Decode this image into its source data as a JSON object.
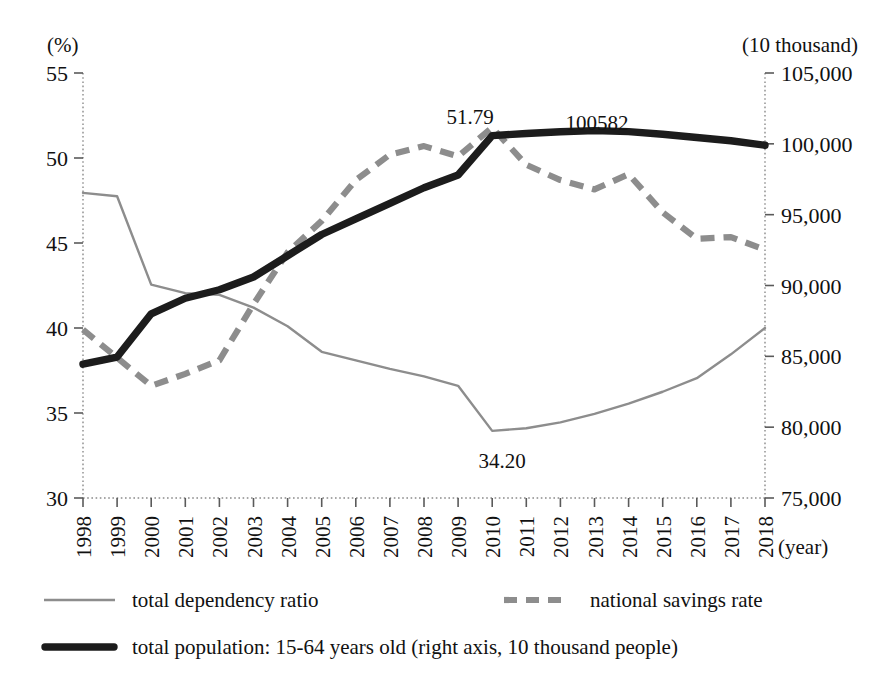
{
  "chart_data": {
    "type": "line",
    "title": "",
    "xlabel": "(year)",
    "ylabel": "(%)",
    "y2label": "(10 thousand)",
    "grid": false,
    "legend_position": "bottom",
    "x": [
      1998,
      1999,
      2000,
      2001,
      2002,
      2003,
      2004,
      2005,
      2006,
      2007,
      2008,
      2009,
      2010,
      2011,
      2012,
      2013,
      2014,
      2015,
      2016,
      2017,
      2018
    ],
    "categories": [
      "1998",
      "1999",
      "2000",
      "2001",
      "2002",
      "2003",
      "2004",
      "2005",
      "2006",
      "2007",
      "2008",
      "2009",
      "2010",
      "2011",
      "2012",
      "2013",
      "2014",
      "2015",
      "2016",
      "2017",
      "2018"
    ],
    "ylim": [
      30,
      55
    ],
    "yticks": [
      30,
      35,
      40,
      45,
      50,
      55
    ],
    "ytick_labels": [
      "30",
      "35",
      "40",
      "45",
      "50",
      "55"
    ],
    "y2lim": [
      75000,
      105000
    ],
    "y2ticks": [
      75000,
      80000,
      85000,
      90000,
      95000,
      100000,
      105000
    ],
    "y2tick_labels": [
      "75,000",
      "80,000",
      "85,000",
      "90,000",
      "95,000",
      "100,000",
      "105,000"
    ],
    "series": [
      {
        "name": "total dependency ratio",
        "axis": "left",
        "style": "thin-solid",
        "color": "#8d8d8d",
        "values": [
          47.95,
          47.75,
          42.55,
          42.05,
          41.95,
          41.2,
          40.1,
          38.6,
          38.1,
          37.6,
          37.15,
          36.6,
          33.95,
          34.1,
          34.45,
          34.95,
          35.55,
          36.25,
          37.05,
          38.45,
          40.0
        ]
      },
      {
        "name": "national savings rate",
        "axis": "left",
        "style": "dashed",
        "color": "#8d8d8d",
        "values": [
          39.9,
          38.25,
          36.6,
          37.3,
          38.1,
          41.4,
          44.45,
          46.3,
          48.7,
          50.2,
          50.7,
          50.1,
          51.79,
          49.6,
          48.7,
          48.15,
          49.05,
          46.8,
          45.25,
          45.35,
          44.6
        ]
      },
      {
        "name": "total population: 15-64 years old (right axis, 10 thousand people)",
        "axis": "right",
        "style": "thick-solid",
        "color": "#1c1c1c",
        "values": [
          84450,
          84950,
          88000,
          89100,
          89700,
          90600,
          92100,
          93600,
          94700,
          95800,
          96900,
          97800,
          100582,
          100730,
          100850,
          100930,
          100860,
          100680,
          100450,
          100220,
          99900
        ]
      }
    ],
    "annotations": [
      {
        "text": "51.79",
        "series": "national savings rate",
        "x": 2010,
        "value": 51.79
      },
      {
        "text": "100582",
        "series": "total population: 15-64 years old (right axis, 10 thousand people)",
        "x": 2010,
        "value": 100582
      },
      {
        "text": "34.20",
        "series": "total dependency ratio",
        "x": 2010,
        "value": 33.95
      }
    ]
  },
  "axes": {
    "left_unit": "(%)",
    "right_unit": "(10 thousand)",
    "x_unit": "(year)"
  },
  "legend": {
    "items": [
      {
        "label": "total dependency ratio",
        "style": "thin-solid"
      },
      {
        "label": "national savings rate",
        "style": "dashed"
      },
      {
        "label": "total population: 15-64 years old (right axis, 10 thousand people)",
        "style": "thick-solid"
      }
    ]
  }
}
